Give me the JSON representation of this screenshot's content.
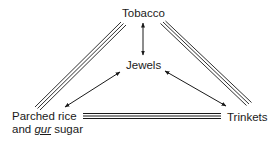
{
  "diagram": {
    "nodes": {
      "top": {
        "label": "Tobacco"
      },
      "center": {
        "label": "Jewels"
      },
      "bottom_left": {
        "line1": "Parched rice",
        "line2_pre": "and ",
        "line2_em": "gur",
        "line2_post": " sugar"
      },
      "bottom_right": {
        "label": "Trinkets"
      }
    },
    "edges": [
      {
        "from": "Tobacco",
        "to": "Parched rice and gur sugar",
        "style": "triple-line"
      },
      {
        "from": "Tobacco",
        "to": "Trinkets",
        "style": "triple-line"
      },
      {
        "from": "Parched rice and gur sugar",
        "to": "Trinkets",
        "style": "triple-line"
      },
      {
        "from": "Tobacco",
        "to": "Jewels",
        "style": "double-arrow"
      },
      {
        "from": "Jewels",
        "to": "Parched rice and gur sugar",
        "style": "double-arrow"
      },
      {
        "from": "Jewels",
        "to": "Trinkets",
        "style": "double-arrow"
      }
    ]
  }
}
